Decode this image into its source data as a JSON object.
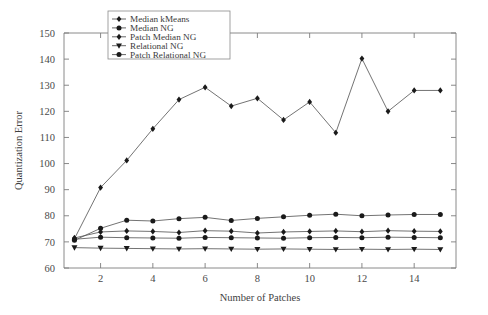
{
  "chart_data": {
    "type": "line",
    "title": "",
    "xlabel": "Number of Patches",
    "ylabel": "Quantization Error",
    "xlim": [
      0.6,
      15.6
    ],
    "ylim": [
      60,
      150
    ],
    "xticks": [
      2,
      4,
      6,
      8,
      10,
      12,
      14
    ],
    "yticks": [
      60,
      70,
      80,
      90,
      100,
      110,
      120,
      130,
      140,
      150
    ],
    "grid": false,
    "legend_position": "top-left-inside",
    "x": [
      1,
      2,
      3,
      4,
      5,
      6,
      7,
      8,
      9,
      10,
      11,
      12,
      13,
      14,
      15
    ],
    "series": [
      {
        "name": "Median kMeans",
        "marker": "diamond",
        "values": [
          71.5,
          73.8,
          74.2,
          74.0,
          73.6,
          74.3,
          74.1,
          73.4,
          73.8,
          74.0,
          74.2,
          73.9,
          74.3,
          74.1,
          74.0
        ]
      },
      {
        "name": "Median NG",
        "marker": "circle",
        "values": [
          71.0,
          71.8,
          71.6,
          71.5,
          71.4,
          71.7,
          71.6,
          71.5,
          71.4,
          71.6,
          71.7,
          71.6,
          71.8,
          71.7,
          71.6
        ]
      },
      {
        "name": "Patch Median NG",
        "marker": "diamond",
        "values": [
          71.2,
          90.8,
          101.2,
          113.3,
          124.5,
          129.2,
          122.0,
          125.0,
          116.7,
          123.6,
          111.8,
          140.2,
          120.0,
          128.0,
          128.0
        ]
      },
      {
        "name": "Relational NG",
        "marker": "triangle-down",
        "values": [
          67.8,
          67.6,
          67.5,
          67.4,
          67.3,
          67.4,
          67.3,
          67.2,
          67.3,
          67.2,
          67.1,
          67.2,
          67.1,
          67.2,
          67.1
        ]
      },
      {
        "name": "Patch Relational NG",
        "marker": "circle",
        "values": [
          70.6,
          75.2,
          78.3,
          78.0,
          78.9,
          79.4,
          78.2,
          79.0,
          79.6,
          80.2,
          80.6,
          80.0,
          80.3,
          80.5,
          80.5
        ]
      }
    ],
    "series_order_drawn": [
      "Patch Median NG",
      "Patch Relational NG",
      "Median kMeans",
      "Median NG",
      "Relational NG"
    ]
  },
  "colors": {
    "background": "#ffffff",
    "axis": "#7d7d7d",
    "line": "#5a5a5a",
    "marker": "#1a1a1a",
    "text": "#3a3a3a"
  }
}
